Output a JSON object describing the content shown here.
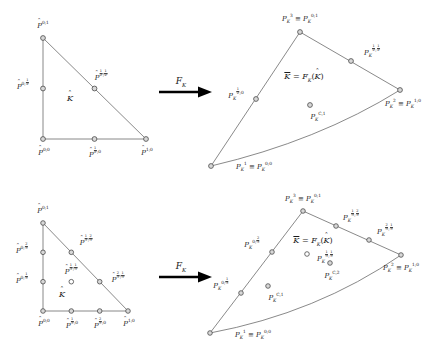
{
  "figure": {
    "colors": {
      "stroke": "#6b6b6b",
      "node_fill": "#d8d8d8",
      "node_stroke": "#4a4a4a",
      "text": "#1a1a1a",
      "arrow": "#000000"
    },
    "panels": [
      {
        "id": "quadratic-reference",
        "role": "reference-element",
        "degree": 2,
        "element_label": "K̂",
        "nodes": [
          {
            "name": "P̂^{0;1}",
            "x": 0,
            "y": 1
          },
          {
            "name": "P̂^{0;1/2}",
            "x": 0,
            "y": 0.5
          },
          {
            "name": "P̂^{0;0}",
            "x": 0,
            "y": 0
          },
          {
            "name": "P̂^{1/2;0}",
            "x": 0.5,
            "y": 0
          },
          {
            "name": "P̂^{1;0}",
            "x": 1,
            "y": 0
          },
          {
            "name": "P̂^{1/2;1/2}",
            "x": 0.5,
            "y": 0.5
          }
        ]
      },
      {
        "id": "quadratic-mapped",
        "role": "mapped-element",
        "degree": 2,
        "element_label": "K̄ = F_K(K̂)",
        "nodes": [
          {
            "name": "P_K^3 ≡ P_K^{0;1}"
          },
          {
            "name": "P_K^{1/2;1/2}"
          },
          {
            "name": "P_K^2 ≡ P_K^{1;0}"
          },
          {
            "name": "P_K^{C,1}"
          },
          {
            "name": "P_K^1 ≡ P_K^{0;0}"
          },
          {
            "name": "P_K^{1/2;0}"
          }
        ]
      },
      {
        "id": "cubic-reference",
        "role": "reference-element",
        "degree": 3,
        "element_label": "K̂",
        "nodes": [
          {
            "name": "P̂^{0;1}",
            "x": 0,
            "y": 1
          },
          {
            "name": "P̂^{0;2/3}",
            "x": 0,
            "y": 0.6667
          },
          {
            "name": "P̂^{0;1/3}",
            "x": 0,
            "y": 0.3333
          },
          {
            "name": "P̂^{0;0}",
            "x": 0,
            "y": 0
          },
          {
            "name": "P̂^{1/3;0}",
            "x": 0.3333,
            "y": 0
          },
          {
            "name": "P̂^{2/3;0}",
            "x": 0.6667,
            "y": 0
          },
          {
            "name": "P̂^{1;0}",
            "x": 1,
            "y": 0
          },
          {
            "name": "P̂^{1/3;2/3}",
            "x": 0.3333,
            "y": 0.6667
          },
          {
            "name": "P̂^{2/3;1/3}",
            "x": 0.6667,
            "y": 0.3333
          },
          {
            "name": "P̂^{1/3;1/3}",
            "x": 0.3333,
            "y": 0.3333
          }
        ]
      },
      {
        "id": "cubic-mapped",
        "role": "mapped-element",
        "degree": 3,
        "element_label": "K̄ = F_K(K̂)",
        "nodes": [
          {
            "name": "P_K^3 ≡ P_K^{0;1}"
          },
          {
            "name": "P_K^{1/3;2/3}"
          },
          {
            "name": "P_K^{2/3;1/3}"
          },
          {
            "name": "P_K^2 ≡ P_K^{1;0}"
          },
          {
            "name": "P_K^{C,2}"
          },
          {
            "name": "P_K^{C,1}"
          },
          {
            "name": "P_K^1 ≡ P_K^{0;0}"
          },
          {
            "name": "P_K^{0;1/3}"
          },
          {
            "name": "P_K^{0;2/3}"
          },
          {
            "name": "P_K^{1/3;1/3}"
          }
        ]
      }
    ],
    "arrows": [
      {
        "id": "arrow-top",
        "label": "F_K"
      },
      {
        "id": "arrow-bottom",
        "label": "F_K"
      }
    ]
  }
}
